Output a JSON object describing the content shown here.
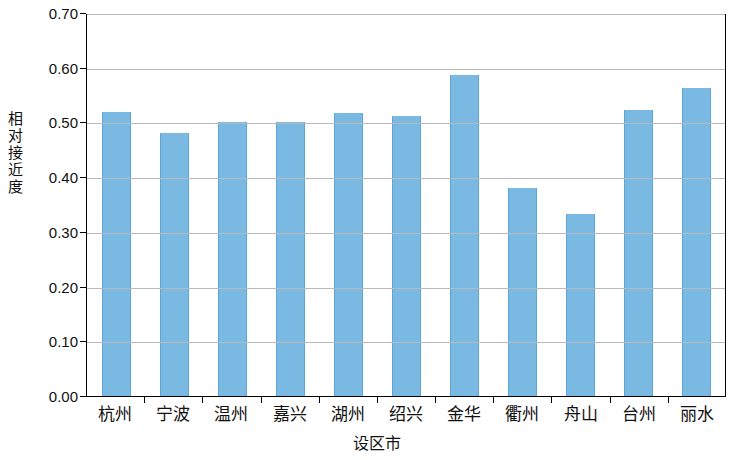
{
  "chart_data": {
    "type": "bar",
    "title": "",
    "xlabel": "设区市",
    "ylabel": "相对接近度",
    "categories": [
      "杭州",
      "宁波",
      "温州",
      "嘉兴",
      "湖州",
      "绍兴",
      "金华",
      "衢州",
      "舟山",
      "台州",
      "丽水"
    ],
    "values": [
      0.52,
      0.48,
      0.5,
      0.5,
      0.517,
      0.512,
      0.586,
      0.38,
      0.332,
      0.522,
      0.563
    ],
    "ylim": [
      0.0,
      0.7
    ],
    "ytick_labels": [
      "0.70",
      "0.60",
      "0.50",
      "0.40",
      "0.30",
      "0.20",
      "0.10",
      "0.00"
    ],
    "ytick_values": [
      0.7,
      0.6,
      0.5,
      0.4,
      0.3,
      0.2,
      0.1,
      0.0
    ],
    "grid": true,
    "legend": null,
    "bar_color": "#79b9e2",
    "bar_edge_color": "#5ba6d6",
    "grid_color": "#b9b9b9",
    "axis_color": "#000000"
  },
  "ylabel_chars": [
    "相",
    "对",
    "接",
    "近",
    "度"
  ]
}
